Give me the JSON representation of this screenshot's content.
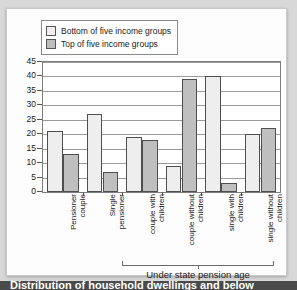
{
  "caption": {
    "text": "Distribution of household dwellings and below"
  },
  "legend": {
    "position": "top-left",
    "items": [
      {
        "label": "Bottom of five income groups",
        "color": "#efefef",
        "swatch": "bottom"
      },
      {
        "label": "Top of five income groups",
        "color": "#bdbdbd",
        "swatch": "top"
      }
    ]
  },
  "annotation": {
    "bracket_label": "Under state pension age",
    "bracket_covers": [
      "couple with children",
      "couple without children",
      "single with children",
      "single without children"
    ]
  },
  "chart_data": {
    "type": "bar",
    "title": "",
    "subtitle": "",
    "xlabel": "",
    "ylabel": "",
    "ylim": [
      0,
      45
    ],
    "yticks": [
      0,
      5,
      10,
      15,
      20,
      25,
      30,
      35,
      40,
      45
    ],
    "ytick_labels": [
      "0",
      "5",
      "10",
      "15",
      "20",
      "25",
      "30",
      "35",
      "40",
      "45"
    ],
    "grid": true,
    "grid_axis": "y",
    "legend_position": "top-left",
    "categories": [
      "Pensioner couple",
      "Single pensioner",
      "couple with children",
      "couple without children",
      "single with children",
      "single without children"
    ],
    "category_lines": [
      [
        "Pensioner",
        "couple"
      ],
      [
        "Single",
        "pensioner"
      ],
      [
        "couple with",
        "children"
      ],
      [
        "couple without",
        "children"
      ],
      [
        "single with",
        "children"
      ],
      [
        "single without",
        "children"
      ]
    ],
    "series": [
      {
        "name": "Bottom of five income groups",
        "color": "#eeeeee",
        "values": [
          21,
          27,
          19,
          9,
          40,
          20
        ]
      },
      {
        "name": "Top of five income groups",
        "color": "#bfbfbf",
        "values": [
          13,
          7,
          18,
          39,
          3,
          22
        ]
      }
    ]
  },
  "colors": {
    "page_background": "#d8d8d8",
    "card_background": "#fdfdfd",
    "plot_background": "#ffffff",
    "gridline": "#9b9b9b",
    "axis": "#7d7d7d",
    "bar_outline": "#4e4e4e",
    "caption_strip": "#4a4a4a",
    "text": "#1a1a1a"
  }
}
